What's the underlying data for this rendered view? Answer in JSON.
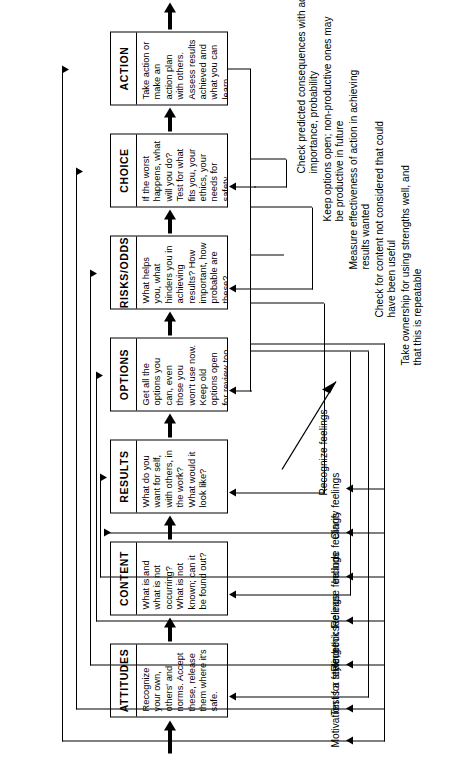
{
  "diagram": {
    "orientation": "rotated-90-ccw",
    "stages": [
      {
        "id": "attitudes",
        "title": "ATTITUDES",
        "body": "Recognize your own, others' and norms. Accept these, release them where it's safe."
      },
      {
        "id": "content",
        "title": "CONTENT",
        "body": "What is and what is not occurring? What is not known; can it be found out?"
      },
      {
        "id": "results",
        "title": "RESULTS",
        "body": "What do you want for self, with others, in the work? What would it look like?"
      },
      {
        "id": "options",
        "title": "OPTIONS",
        "body": "Get all the options you can, even those you won't use now. Keep old options open for review too."
      },
      {
        "id": "risks-odds",
        "title": "RISKS/ODDS",
        "body": "What helps you, what hinders you in achieving results? How important, how probable are these?"
      },
      {
        "id": "choice",
        "title": "CHOICE",
        "body": "If the worst happens, what will you do? Test for what fits you, your ethics, your needs for safety."
      },
      {
        "id": "action",
        "title": "ACTION",
        "body": "Take action or make an action plan with others. Assess results achieved and what you can learn."
      }
    ],
    "feelings_labels": [
      {
        "id": "recognize-feelings",
        "text": "Recognize feelings"
      },
      {
        "id": "clarify-feelings",
        "text": "Clarify feelings"
      },
      {
        "id": "include-feelings",
        "text": "Include feelings"
      },
      {
        "id": "release-feelings",
        "text": "Release feelings"
      },
      {
        "id": "recheck-feelings",
        "text": "Recheck feelings"
      },
      {
        "id": "test-for-style-ethics",
        "text": "Test for style, ethics"
      },
      {
        "id": "motivation-is-a-feeling",
        "text": "Motivation is a feeling"
      }
    ],
    "review_notes": [
      {
        "id": "note-consequences",
        "text": "Check predicted consequences with actual, for importance, probability"
      },
      {
        "id": "note-options-open",
        "text": "Keep options open; non-productive ones may be productive in future"
      },
      {
        "id": "note-effectiveness",
        "text": "Measure effectiveness of action in achieving results wanted"
      },
      {
        "id": "note-content-check",
        "text": "Check for content not considered that could have been useful"
      },
      {
        "id": "note-ownership",
        "text": "Take ownership for using strengths well, and that this is repeatable"
      }
    ],
    "colors": {
      "ink": "#000000",
      "paper": "#ffffff"
    }
  }
}
